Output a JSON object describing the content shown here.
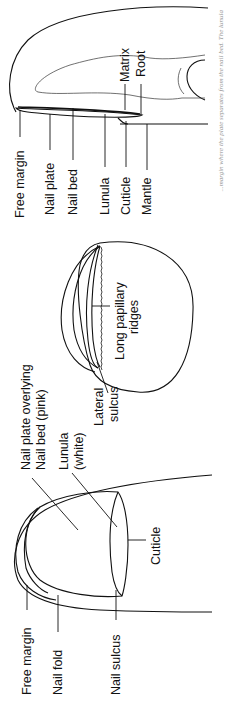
{
  "figure": {
    "sagittal_view": {
      "labels": {
        "free_margin": "Free margin",
        "nail_plate": "Nail plate",
        "nail_bed": "Nail bed",
        "lunula": "Lunula",
        "cuticle": "Cuticle",
        "mantle": "Mantle",
        "matrix": "Matrix",
        "root": "Root"
      }
    },
    "transverse_view": {
      "labels": {
        "long_papillary_ridges_line1": "Long papillary",
        "long_papillary_ridges_line2": "ridges",
        "lateral_sulcus_line1": "Lateral",
        "lateral_sulcus_line2": "sulcus"
      }
    },
    "dorsal_view": {
      "labels": {
        "nail_plate_overlying_line1": "Nail plate overlying",
        "nail_plate_overlying_line2": "Nail bed (pink)",
        "lunula_line1": "Lunula",
        "lunula_line2": "(white)",
        "cuticle": "Cuticle",
        "free_margin": "Free margin",
        "nail_fold": "Nail fold",
        "nail_sulcus": "Nail sulcus"
      }
    },
    "caption": {
      "text": "...margin where the plate separates from the nail bed. The lunula"
    }
  }
}
